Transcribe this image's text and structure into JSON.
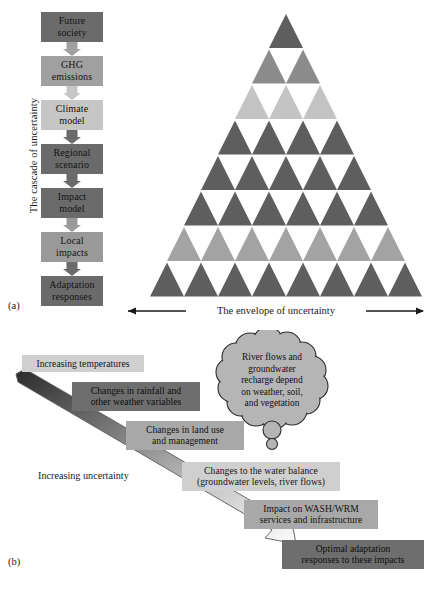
{
  "figure": {
    "panel_a_label": "(a)",
    "panel_b_label": "(b)"
  },
  "panel_a": {
    "axis_vertical_label": "The cascade of uncertainty",
    "axis_horizontal_label": "The envelope of uncertainty",
    "cascade": [
      {
        "label": "Future society",
        "line1": "Future",
        "line2": "society",
        "tone": "#6b6b6b"
      },
      {
        "label": "GHG emissions",
        "line1": "GHG",
        "line2": "emissions",
        "tone": "#a0a0a0"
      },
      {
        "label": "Climate model",
        "line1": "Climate",
        "line2": "model",
        "tone": "#c6c6c6"
      },
      {
        "label": "Regional scenario",
        "line1": "Regional",
        "line2": "scenario",
        "tone": "#6b6b6b"
      },
      {
        "label": "Impact model",
        "line1": "Impact",
        "line2": "model",
        "tone": "#6b6b6b"
      },
      {
        "label": "Local impacts",
        "line1": "Local",
        "line2": "impacts",
        "tone": "#9a9a9a"
      },
      {
        "label": "Adaptation responses",
        "line1": "Adaptation",
        "line2": "responses",
        "tone": "#6b6b6b"
      }
    ],
    "pyramid": {
      "rows": 8,
      "row_colors": [
        "#5e5e5e",
        "#8c8c8c",
        "#c4c4c4",
        "#5e5e5e",
        "#5e5e5e",
        "#5e5e5e",
        "#a3a3a3",
        "#5e5e5e"
      ],
      "gap_color": "#ffffff"
    }
  },
  "panel_b": {
    "gradient_label": "Increasing uncertainty",
    "boxes": [
      {
        "id": "increasing-temperatures",
        "line1": "Increasing temperatures",
        "line2": "",
        "tone": "light"
      },
      {
        "id": "changes-rainfall",
        "line1": "Changes in rainfall and",
        "line2": "other weather variables",
        "tone": "dark"
      },
      {
        "id": "changes-land-use",
        "line1": "Changes in land use",
        "line2": "and management",
        "tone": "mid"
      },
      {
        "id": "changes-water-balance",
        "line1": "Changes to the water balance",
        "line2": "(groundwater levels, river flows)",
        "tone": "light"
      },
      {
        "id": "impact-wash-wrm",
        "line1": "Impact on WASH/WRM",
        "line2": "services and infrastructure",
        "tone": "mid"
      },
      {
        "id": "optimal-adaptation",
        "line1": "Optimal adaptation",
        "line2": "responses to these impacts",
        "tone": "dark"
      }
    ],
    "thought_cloud": {
      "lines": [
        "River flows and",
        "groundwater",
        "recharge depend",
        "on weather, soil,",
        "and vegetation"
      ],
      "fill": "#b5b5b5",
      "stroke": "#2b2b2b"
    }
  }
}
